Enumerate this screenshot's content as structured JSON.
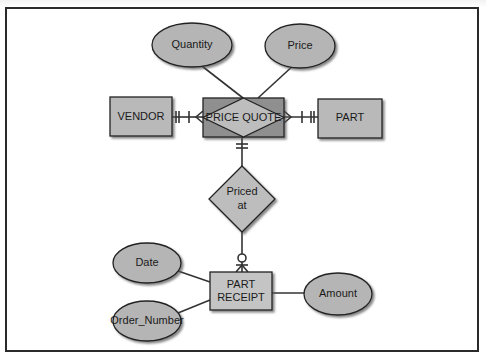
{
  "diagram": {
    "type": "entity-relationship",
    "notation": "crow's foot",
    "colors": {
      "entity_fill": "#b9b9b9",
      "associative_fill": "#8f8f8f",
      "attribute_fill": "#b5b5b5",
      "relationship_fill": "#bdbdbd",
      "line": "#333333",
      "frame": "#2a2a2a"
    },
    "attributes": {
      "quantity": "Quantity",
      "price": "Price",
      "date": "Date",
      "order_number": "Order_Number",
      "amount": "Amount"
    },
    "entities": {
      "vendor": "VENDOR",
      "part": "PART",
      "part_receipt_line1": "PART",
      "part_receipt_line2": "RECEIPT"
    },
    "associative_entity": {
      "price_quote": "PRICE QUOTE"
    },
    "relationships": {
      "priced_at_line1": "Priced",
      "priced_at_line2": "at"
    }
  }
}
